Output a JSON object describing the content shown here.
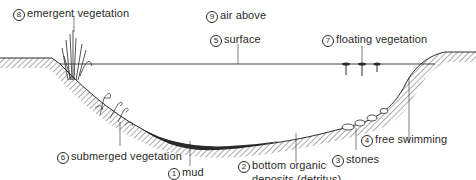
{
  "diagram": {
    "type": "pond cross-section habitats",
    "colors": {
      "ink": "#2a2a2a",
      "background": "#ffffff"
    },
    "labels": [
      {
        "id": "emergent",
        "number": "8",
        "text": "emergent vegetation"
      },
      {
        "id": "air",
        "number": "9",
        "text": "air above"
      },
      {
        "id": "surface",
        "number": "5",
        "text": "surface"
      },
      {
        "id": "floating",
        "number": "7",
        "text": "floating vegetation"
      },
      {
        "id": "free_swimming",
        "number": "4",
        "text": "free swimming"
      },
      {
        "id": "stones",
        "number": "3",
        "text": "stones"
      },
      {
        "id": "bottom",
        "number": "2",
        "text": "bottom organic",
        "text2": "deposits (detritus)"
      },
      {
        "id": "mud",
        "number": "1",
        "text": "mud"
      },
      {
        "id": "submerged",
        "number": "6",
        "text": "submerged vegetation"
      }
    ]
  }
}
